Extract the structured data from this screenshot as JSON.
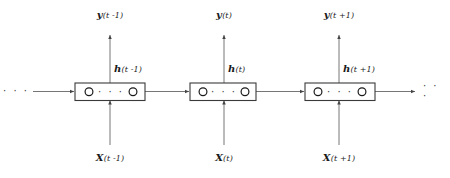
{
  "figure": {
    "background_color": "#ffffff",
    "line_color": "#555555",
    "box_stroke_color": "#3a3a3a",
    "text_color": "#1a1a1a"
  },
  "left_ellipsis": "· · ·",
  "right_ellipsis": "· · ·",
  "cells": [
    {
      "id": "t-minus-1",
      "output_var": "y",
      "output_index": "(t -1)",
      "hidden_var": "h",
      "hidden_index": "(t -1)",
      "input_var": "X",
      "input_index": "(t -1)",
      "inner_dots": "· · ·",
      "units": [
        "unit-first",
        "unit-last"
      ]
    },
    {
      "id": "t",
      "output_var": "y",
      "output_index": "(t)",
      "hidden_var": "h",
      "hidden_index": "(t)",
      "input_var": "X",
      "input_index": "(t)",
      "inner_dots": "· · ·",
      "units": [
        "unit-first",
        "unit-last"
      ]
    },
    {
      "id": "t-plus-1",
      "output_var": "y",
      "output_index": "(t +1)",
      "hidden_var": "h",
      "hidden_index": "(t +1)",
      "input_var": "X",
      "input_index": "(t +1)",
      "inner_dots": "· · ·",
      "units": [
        "unit-first",
        "unit-last"
      ]
    }
  ]
}
